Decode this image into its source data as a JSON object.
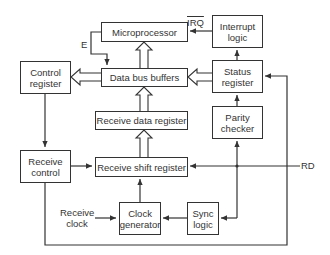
{
  "diagram": {
    "blocks": {
      "microprocessor": "Microprocessor",
      "interrupt_logic_1": "Interrupt",
      "interrupt_logic_2": "logic",
      "data_bus_buffers": "Data bus buffers",
      "status_register_1": "Status",
      "status_register_2": "register",
      "control_register_1": "Control",
      "control_register_2": "register",
      "receive_data_register": "Receive data register",
      "parity_checker_1": "Parity",
      "parity_checker_2": "checker",
      "receive_shift_register": "Receive shift register",
      "receive_control_1": "Receive",
      "receive_control_2": "control",
      "clock_generator_1": "Clock",
      "clock_generator_2": "generator",
      "sync_logic_1": "Sync",
      "sync_logic_2": "logic"
    },
    "signals": {
      "irq": "IRQ",
      "e": "E",
      "rd": "RD",
      "receive_clock_1": "Receive",
      "receive_clock_2": "clock"
    },
    "colors": {
      "line": "#333333",
      "background": "#ffffff"
    }
  }
}
